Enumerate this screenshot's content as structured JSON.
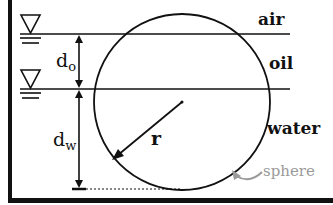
{
  "diagram": {
    "labels": {
      "air": "air",
      "oil": "oil",
      "water": "water",
      "sphere": "sphere",
      "d_o_main": "d",
      "d_o_sub": "o",
      "d_w_main": "d",
      "d_w_sub": "w",
      "radius": "r"
    },
    "colors": {
      "line": "#111111",
      "sphere_label": "#9a9a9a",
      "background": "#ffffff"
    },
    "layers": [
      {
        "name": "air",
        "surface_y": null
      },
      {
        "name": "oil",
        "surface_y": 34
      },
      {
        "name": "water",
        "surface_y": 89
      }
    ],
    "sphere": {
      "cx": 182,
      "cy": 102,
      "r": 88
    }
  }
}
